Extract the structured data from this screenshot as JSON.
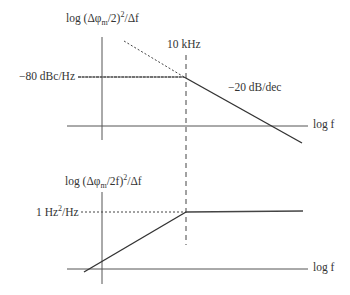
{
  "top_plot": {
    "ylabel_prefix": "log (Δφ",
    "ylabel_sub": "m",
    "ylabel_mid": "/2)",
    "ylabel_sup": "2",
    "ylabel_suffix": "/Δf",
    "level_label": "−80 dBc/Hz",
    "corner_label": "10 kHz",
    "slope_label": "−20 dB/dec",
    "xlabel": "log f"
  },
  "bottom_plot": {
    "ylabel_prefix": "log (Δφ",
    "ylabel_sub": "m",
    "ylabel_mid": "/2f)",
    "ylabel_sup": "2",
    "ylabel_suffix": "/Δf",
    "level_label_pre": "1 Hz",
    "level_label_sup": "2",
    "level_label_post": "/Hz",
    "xlabel": "log f"
  },
  "colors": {
    "line": "#333333",
    "background": "#ffffff"
  }
}
